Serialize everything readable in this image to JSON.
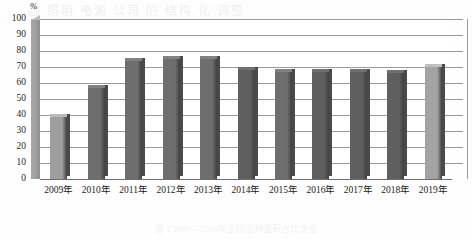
{
  "figure": {
    "watermark": "圆 照明 电源 公司 的 结构 化 调整",
    "caption": "图 2  2009—2019年全国造林面积占比变化"
  },
  "chart_data": {
    "type": "bar",
    "title": "",
    "xlabel": "",
    "ylabel": "%",
    "ylim": [
      0,
      100
    ],
    "yticks": [
      0,
      10,
      20,
      30,
      40,
      50,
      60,
      70,
      80,
      90,
      100
    ],
    "grid": true,
    "legend": "none",
    "categories": [
      "2009年",
      "2010年",
      "2011年",
      "2012年",
      "2013年",
      "2014年",
      "2015年",
      "2016年",
      "2017年",
      "2018年",
      "2019年"
    ],
    "values": [
      39,
      57,
      74,
      75,
      75,
      68,
      67,
      67,
      67,
      66,
      70
    ],
    "bar_colors": [
      "#9e9e9e",
      "#6e6e6e",
      "#6e6e6e",
      "#6e6e6e",
      "#6e6e6e",
      "#5f5f5f",
      "#6e6e6e",
      "#5f5f5f",
      "#5f5f5f",
      "#5f5f5f",
      "#a3a3a3"
    ],
    "accent": "#6e6e6e",
    "grid_color": "#9a9a9a"
  }
}
